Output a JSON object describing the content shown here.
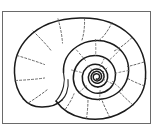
{
  "figure": {
    "caption": "",
    "background_color": "#ffffff",
    "frame": {
      "border_color": "#6a6a6a",
      "border_width_px": 1,
      "x": 2,
      "y": 11,
      "width": 149,
      "height": 113
    },
    "drawing": {
      "ink_color": "#1a1a1a",
      "growth_line_color": "#4a4a4a",
      "line_style": "solid-outline-with-dashed-radials",
      "spiral_center": {
        "x": 97,
        "y": 75
      },
      "spiral_turns": 3.25,
      "aperture_position": "lower-left",
      "coiling_direction": "counter-clockwise",
      "element_count": {
        "outline_curves": 4,
        "dashed_radials": 14,
        "inner_whorl_arcs": 3
      }
    }
  }
}
